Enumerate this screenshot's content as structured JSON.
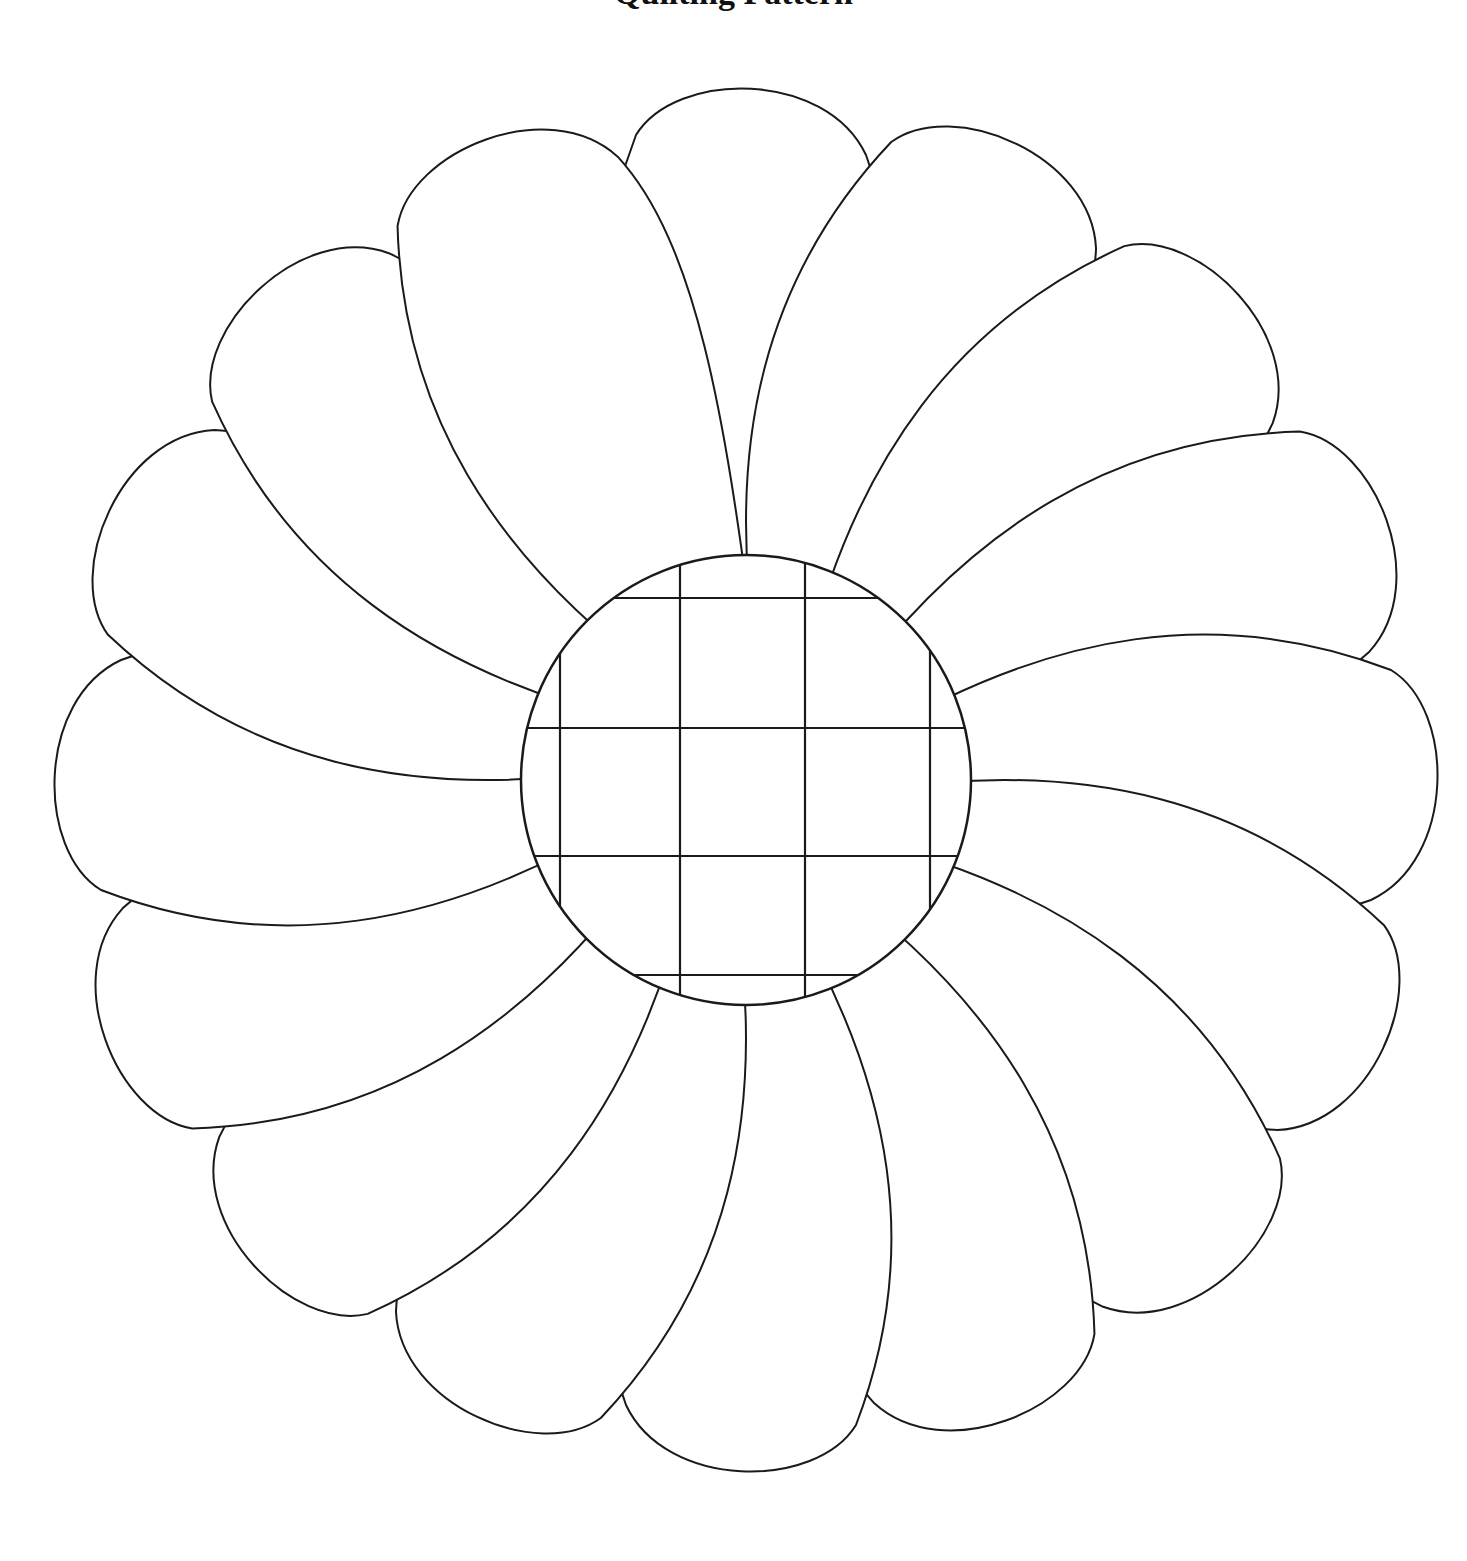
{
  "title": "Quilting Pattern",
  "pattern": {
    "type": "flower",
    "petal_count": 16,
    "center": {
      "cx": 746,
      "cy": 780,
      "r": 225
    },
    "petal_outer_radius": 705,
    "stroke_color": "#1a1a1a",
    "fill_color": "#ffffff",
    "grid": {
      "vertical_x": [
        560,
        680,
        805,
        930
      ],
      "horizontal_y": [
        598,
        728,
        856,
        975
      ]
    }
  }
}
